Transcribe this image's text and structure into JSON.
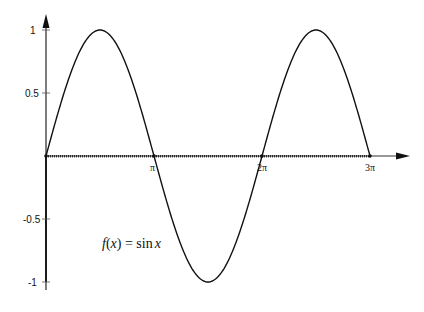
{
  "chart_data": {
    "type": "line",
    "title": "",
    "function_label": "f(x) = sin x",
    "function_label_parts": {
      "f": "f",
      "open": "(",
      "x": "x",
      "close": ")",
      "eq": " = ",
      "sin": "sin",
      "arg": "x"
    },
    "xlabel": "",
    "ylabel": "",
    "xlim": [
      0,
      9.42477796
    ],
    "ylim": [
      -1,
      1
    ],
    "x_ticks": [
      {
        "value": 3.14159265,
        "label": "π"
      },
      {
        "value": 6.28318531,
        "label": "2π"
      },
      {
        "value": 9.42477796,
        "label": "3π"
      }
    ],
    "y_ticks": [
      {
        "value": 1,
        "label": "1"
      },
      {
        "value": 0.5,
        "label": "0.5"
      },
      {
        "value": -0.5,
        "label": "-0.5"
      },
      {
        "value": -1,
        "label": "-1"
      }
    ],
    "grid": false,
    "legend": null,
    "series": [
      {
        "name": "sin x",
        "x": [
          0,
          0.785,
          1.571,
          2.356,
          3.142,
          3.927,
          4.712,
          5.498,
          6.283,
          7.069,
          7.854,
          8.639,
          9.425
        ],
        "values": [
          0,
          0.707,
          1,
          0.707,
          0,
          -0.707,
          -1,
          -0.707,
          0,
          0.707,
          1,
          0.707,
          0
        ]
      }
    ],
    "points": [
      {
        "x": 0,
        "y": 0
      },
      {
        "x": 3.14159265,
        "y": 0
      },
      {
        "x": 6.28318531,
        "y": 0
      },
      {
        "x": 9.42477796,
        "y": 0
      }
    ]
  },
  "labels": {
    "y_1": "1",
    "y_05": "0.5",
    "y_m05": "-0.5",
    "y_m1": "-1",
    "x_pi": "π",
    "x_2pi": "2π",
    "x_3pi": "3π"
  }
}
